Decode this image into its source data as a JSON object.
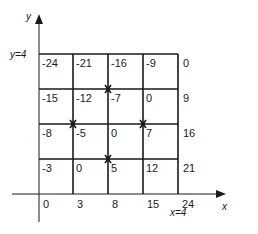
{
  "axes": {
    "x_label": "x",
    "y_label": "y",
    "x_marker": "x=4",
    "y_marker": "y=4",
    "x_ticks": [
      "0",
      "3",
      "8",
      "15",
      "24"
    ]
  },
  "grid": {
    "rows": [
      [
        "-24",
        "-21",
        "-16",
        "-9"
      ],
      [
        "-15",
        "-12",
        "-7",
        "0"
      ],
      [
        "-8",
        "-5",
        "0",
        "7"
      ],
      [
        "-3",
        "0",
        "5",
        "12"
      ]
    ],
    "right_column": [
      "0",
      "9",
      "16",
      "21"
    ]
  },
  "markers": [
    {
      "col": 2,
      "row": 1
    },
    {
      "col": 1,
      "row": 2
    },
    {
      "col": 3,
      "row": 2
    },
    {
      "col": 2,
      "row": 3
    }
  ],
  "colors": {
    "line": "#1a1a1a",
    "background": "#ffffff"
  }
}
